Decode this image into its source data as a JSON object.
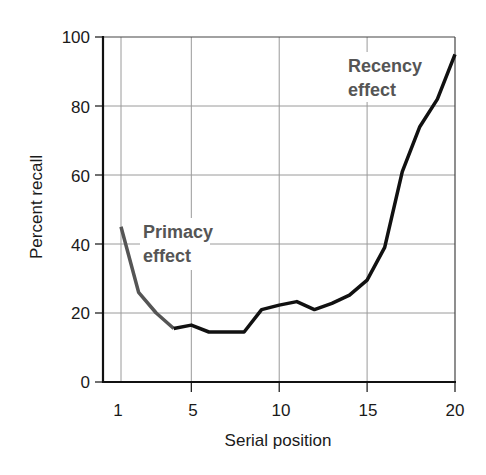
{
  "chart_data": {
    "type": "line",
    "title": "",
    "xlabel": "Serial position",
    "ylabel": "Percent recall",
    "x": [
      1,
      2,
      3,
      4,
      5,
      6,
      7,
      8,
      9,
      10,
      11,
      12,
      13,
      14,
      15,
      16,
      17,
      18,
      19,
      20
    ],
    "series": [
      {
        "name": "Percent recall",
        "values": [
          45,
          26,
          20,
          15.5,
          16.5,
          14.5,
          14.5,
          14.5,
          21,
          22.3,
          23.3,
          21,
          22.8,
          25.2,
          29.5,
          39,
          61,
          74,
          82,
          95
        ]
      }
    ],
    "xticks": [
      1,
      5,
      10,
      15,
      20
    ],
    "yticks": [
      0,
      20,
      40,
      60,
      80,
      100
    ],
    "xlim": [
      0,
      20
    ],
    "ylim": [
      0,
      100
    ],
    "grid": true,
    "legend": "none",
    "annotations": [
      {
        "text_line1": "Primacy",
        "text_line2": "effect",
        "near_x": 2,
        "near_y": 40
      },
      {
        "text_line1": "Recency",
        "text_line2": "effect",
        "near_x": 17.5,
        "near_y": 88
      }
    ],
    "colors": {
      "line": "#111111",
      "primacy_segment": "#555555",
      "annotation": "#555555",
      "grid": "#999999",
      "axis": "#111111"
    }
  },
  "labels": {
    "xlabel": "Serial position",
    "ylabel": "Percent recall",
    "xtick_1": "1",
    "xtick_5": "5",
    "xtick_10": "10",
    "xtick_15": "15",
    "xtick_20": "20",
    "ytick_0": "0",
    "ytick_20": "20",
    "ytick_40": "40",
    "ytick_60": "60",
    "ytick_80": "80",
    "ytick_100": "100",
    "primacy_1": "Primacy",
    "primacy_2": "effect",
    "recency_1": "Recency",
    "recency_2": "effect"
  }
}
